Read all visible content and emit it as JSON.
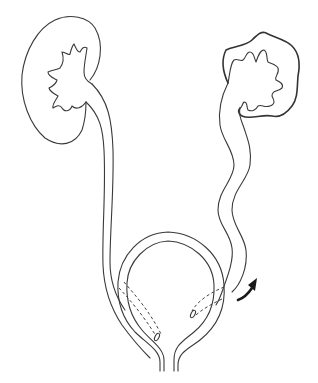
{
  "figure": {
    "elements": [
      {
        "name": "left-kidney",
        "state": "normal"
      },
      {
        "name": "right-kidney",
        "state": "hydronephrotic"
      },
      {
        "name": "left-ureter",
        "state": "straight"
      },
      {
        "name": "right-ureter",
        "state": "tortuous-dilated"
      },
      {
        "name": "bladder"
      },
      {
        "name": "direction-arrow",
        "icon": "curved-arrow-up-right"
      }
    ],
    "colors": {
      "line": "#3a3a3a",
      "arrow": "#1a1a1a",
      "background": "#ffffff"
    }
  }
}
